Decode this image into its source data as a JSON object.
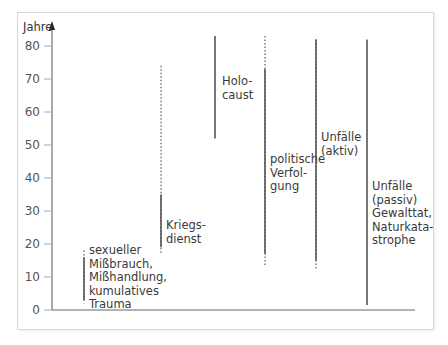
{
  "chart_data": {
    "type": "range-line",
    "title": "",
    "ylabel": "Jahre",
    "xlabel": "",
    "ylim": [
      0,
      85
    ],
    "yticks": [
      0,
      10,
      20,
      30,
      40,
      50,
      60,
      70,
      80
    ],
    "grid": false,
    "legend": "none",
    "series": [
      {
        "name": "sexueller Mißbrauch, Mißhandlung, kumulatives Trauma",
        "label_lines": [
          "sexueller",
          "Mißbrauch,",
          "Mißhandlung,",
          "kumulatives",
          "Trauma"
        ],
        "solid": [
          3,
          16
        ],
        "dotted": [
          2,
          18
        ]
      },
      {
        "name": "Kriegsdienst",
        "label_lines": [
          "Kriegs-",
          "dienst"
        ],
        "solid": [
          19,
          35
        ],
        "dotted": [
          17,
          74
        ]
      },
      {
        "name": "Holocaust",
        "label_lines": [
          "Holo-",
          "caust"
        ],
        "solid": [
          52,
          83
        ],
        "dotted": null
      },
      {
        "name": "politische Verfolgung",
        "label_lines": [
          "politische",
          "Verfol-",
          "gung"
        ],
        "solid": [
          17,
          73
        ],
        "dotted": [
          13,
          83
        ]
      },
      {
        "name": "Unfälle (aktiv)",
        "label_lines": [
          "Unfälle",
          "(aktiv)"
        ],
        "solid": [
          15,
          82
        ],
        "dotted": [
          12,
          82
        ]
      },
      {
        "name": "Unfälle (passiv) Gewalttat, Naturkatastrophe",
        "label_lines": [
          "Unfälle",
          "(passiv)",
          "Gewalttat,",
          "Naturkata-",
          "strophe"
        ],
        "solid": [
          1.5,
          82
        ],
        "dotted": null
      }
    ]
  }
}
